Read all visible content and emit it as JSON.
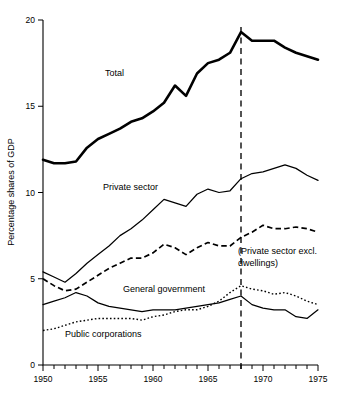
{
  "chart_data": {
    "type": "line",
    "title": "",
    "xlabel": "",
    "ylabel": "Percentage shares of GDP",
    "xlim": [
      1950,
      1975
    ],
    "ylim": [
      0,
      20
    ],
    "grid": false,
    "legend_position": "inline-annotations",
    "y_ticks": [
      "0",
      "5",
      "10",
      "15",
      "20"
    ],
    "y_tick_values": [
      0,
      5,
      10,
      15,
      20
    ],
    "x_ticks": [
      "1950",
      "1955",
      "1960",
      "1965",
      "1970",
      "1975"
    ],
    "x_tick_values": [
      1950,
      1955,
      1960,
      1965,
      1970,
      1975
    ],
    "x_minor_tick_interval": 1,
    "annotations": [
      {
        "name": "vertical-marker",
        "x": 1968,
        "style": "dashed vertical line"
      }
    ],
    "x": [
      1950,
      1951,
      1952,
      1953,
      1954,
      1955,
      1956,
      1957,
      1958,
      1959,
      1960,
      1961,
      1962,
      1963,
      1964,
      1965,
      1966,
      1967,
      1968,
      1969,
      1970,
      1971,
      1972,
      1973,
      1974,
      1975
    ],
    "series": [
      {
        "name": "Total",
        "label": "Total",
        "style": "solid-thick",
        "values": [
          11.9,
          11.7,
          11.7,
          11.8,
          12.6,
          13.1,
          13.4,
          13.7,
          14.1,
          14.3,
          14.7,
          15.2,
          16.2,
          15.6,
          16.9,
          17.5,
          17.7,
          18.1,
          19.3,
          18.8,
          18.8,
          18.8,
          18.4,
          18.1,
          17.9,
          17.7
        ]
      },
      {
        "name": "Private sector",
        "label": "Private sector",
        "style": "solid-thin",
        "values": [
          5.4,
          5.1,
          4.8,
          5.3,
          5.9,
          6.4,
          6.9,
          7.5,
          7.9,
          8.4,
          9.0,
          9.6,
          9.4,
          9.2,
          9.9,
          10.2,
          10.0,
          10.1,
          10.8,
          11.1,
          11.2,
          11.4,
          11.6,
          11.4,
          11.0,
          10.7
        ]
      },
      {
        "name": "Private sector excl. dwellings",
        "label": "(Private sector excl. dwellings)",
        "style": "dashed",
        "values": [
          5.0,
          4.6,
          4.3,
          4.4,
          4.8,
          5.2,
          5.6,
          5.9,
          6.2,
          6.2,
          6.5,
          7.0,
          6.8,
          6.4,
          6.8,
          7.1,
          6.9,
          6.9,
          7.4,
          7.7,
          8.1,
          7.9,
          7.9,
          8.0,
          7.9,
          7.7
        ]
      },
      {
        "name": "General government",
        "label": "General government",
        "style": "dotted",
        "values": [
          2.0,
          2.1,
          2.3,
          2.5,
          2.6,
          2.7,
          2.7,
          2.7,
          2.7,
          2.6,
          2.8,
          2.9,
          3.1,
          3.2,
          3.2,
          3.4,
          3.7,
          4.2,
          4.6,
          4.4,
          4.3,
          4.1,
          4.2,
          4.0,
          3.7,
          3.5
        ]
      },
      {
        "name": "Public corporations",
        "label": "Public corporations",
        "style": "solid-thin",
        "values": [
          3.5,
          3.7,
          3.9,
          4.2,
          4.0,
          3.6,
          3.4,
          3.3,
          3.2,
          3.1,
          3.2,
          3.2,
          3.2,
          3.3,
          3.4,
          3.5,
          3.6,
          3.8,
          4.0,
          3.5,
          3.3,
          3.2,
          3.2,
          2.8,
          2.7,
          3.2
        ]
      }
    ]
  },
  "labels": {
    "y_axis_title": "Percentage shares of GDP",
    "total": "Total",
    "private_sector": "Private sector",
    "private_excl_line1": "(Private sector excl.",
    "private_excl_line2": "dwellings)",
    "general_government": "General government",
    "public_corporations": "Public corporations"
  },
  "ticks": {
    "y": [
      "20",
      "15",
      "10",
      "5",
      "0"
    ],
    "x": [
      "1950",
      "1955",
      "1960",
      "1965",
      "1970",
      "1975"
    ]
  },
  "colors": {
    "ink": "#000000",
    "background": "#ffffff"
  }
}
